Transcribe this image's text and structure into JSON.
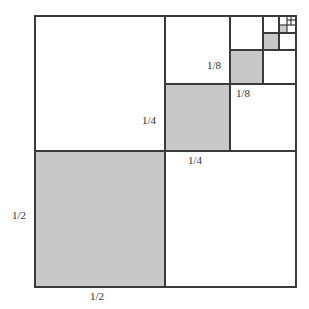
{
  "diagram": {
    "colors": {
      "shaded": "#c8c8c8",
      "line": "#3a3a3a",
      "background": "#ffffff"
    },
    "labels": {
      "half_left": "1/2",
      "half_bottom": "1/2",
      "quarter_left": "1/4",
      "quarter_bottom": "1/4",
      "eighth_left": "1/8",
      "eighth_bottom": "1/8"
    }
  }
}
